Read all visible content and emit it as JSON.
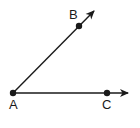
{
  "diagram": {
    "stroke_color": "#1a1a1a",
    "background": "#ffffff",
    "points": [
      {
        "id": "A",
        "label": "A",
        "x": 13,
        "y": 93,
        "label_x": 9,
        "label_y": 109
      },
      {
        "id": "B",
        "label": "B",
        "x": 79,
        "y": 26,
        "label_x": 69,
        "label_y": 19
      },
      {
        "id": "C",
        "label": "C",
        "x": 107,
        "y": 93,
        "label_x": 102,
        "label_y": 109
      }
    ],
    "rays": [
      {
        "id": "ray-AB",
        "from": "A",
        "through": "B",
        "x1": 13,
        "y1": 93,
        "x2": 94,
        "y2": 11
      },
      {
        "id": "ray-AC",
        "from": "A",
        "through": "C",
        "x1": 13,
        "y1": 93,
        "x2": 128,
        "y2": 93
      }
    ]
  }
}
